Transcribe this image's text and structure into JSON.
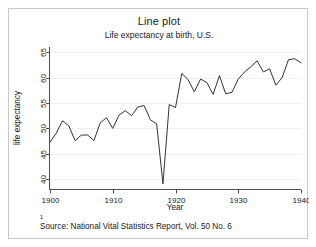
{
  "chart_data": {
    "type": "line",
    "title": "Line plot",
    "subtitle": "Life expectancy at birth, U.S.",
    "xlabel": "Year",
    "ylabel": "life expectancy",
    "xlim": [
      1900,
      1940
    ],
    "ylim": [
      38,
      66
    ],
    "xticks": [
      1900,
      1910,
      1920,
      1930,
      1940
    ],
    "yticks": [
      40,
      45,
      50,
      55,
      60,
      65
    ],
    "grid": true,
    "grid_axis": "y",
    "legend": "none",
    "line_color": "#33333a",
    "footnote_marker": "1",
    "footnote": "Source:  National Vital Statistics Report, Vol. 50 No. 6",
    "x": [
      1900,
      1901,
      1902,
      1903,
      1904,
      1905,
      1906,
      1907,
      1908,
      1909,
      1910,
      1911,
      1912,
      1913,
      1914,
      1915,
      1916,
      1917,
      1918,
      1919,
      1920,
      1921,
      1922,
      1923,
      1924,
      1925,
      1926,
      1927,
      1928,
      1929,
      1930,
      1931,
      1932,
      1933,
      1934,
      1935,
      1936,
      1937,
      1938,
      1939,
      1940
    ],
    "values": [
      47.3,
      49.1,
      51.5,
      50.5,
      47.6,
      48.7,
      48.7,
      47.6,
      51.1,
      52.1,
      50.0,
      52.6,
      53.5,
      52.5,
      54.2,
      54.5,
      51.7,
      50.9,
      39.1,
      54.7,
      54.1,
      60.8,
      59.6,
      57.2,
      59.7,
      59.0,
      56.7,
      60.4,
      56.8,
      57.1,
      59.7,
      61.1,
      62.1,
      63.3,
      61.1,
      61.7,
      58.5,
      60.0,
      63.5,
      63.7,
      62.9
    ]
  },
  "axes": {
    "ytick_labels": [
      "40",
      "45",
      "50",
      "55",
      "60",
      "65"
    ],
    "xtick_labels": [
      "1900",
      "1910",
      "1920",
      "1930",
      "1940"
    ]
  }
}
